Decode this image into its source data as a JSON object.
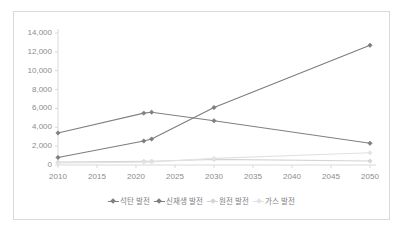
{
  "chart_data": {
    "type": "line",
    "title": "",
    "xlabel": "",
    "ylabel": "",
    "x": [
      2010,
      2021,
      2022,
      2030,
      2050
    ],
    "xlim": [
      2010,
      2050
    ],
    "ylim": [
      0,
      14000
    ],
    "ytick_step": 2000,
    "xtick_step": 5,
    "grid": false,
    "legend_position": "bottom",
    "xticks": [
      "2010",
      "2015",
      "2020",
      "2025",
      "2030",
      "2035",
      "2040",
      "2045",
      "2050"
    ],
    "yticks": [
      "0",
      "2,000",
      "4,000",
      "6,000",
      "8,000",
      "10,000",
      "12,000",
      "14,000"
    ],
    "series": [
      {
        "name": "석탄 발전",
        "color": "#808080",
        "values": [
          3400,
          5500,
          5600,
          4700,
          2300
        ]
      },
      {
        "name": "신재생 발전",
        "color": "#7d7d7d",
        "values": [
          800,
          2550,
          2750,
          6100,
          12700
        ]
      },
      {
        "name": "원전 발전",
        "color": "#d4d4d4",
        "values": [
          300,
          380,
          400,
          600,
          420
        ]
      },
      {
        "name": "가스 발전",
        "color": "#e2e2e2",
        "values": [
          220,
          300,
          320,
          700,
          1300
        ]
      }
    ]
  },
  "axis": {
    "y_labels": [
      "14,000",
      "12,000",
      "10,000",
      "8,000",
      "6,000",
      "4,000",
      "2,000",
      "0"
    ],
    "x_labels": [
      "2010",
      "2015",
      "2020",
      "2025",
      "2030",
      "2035",
      "2040",
      "2045",
      "2050"
    ]
  },
  "legend": {
    "items": [
      {
        "label": "석탄 발전",
        "color": "#808080"
      },
      {
        "label": "신재생 발전",
        "color": "#7d7d7d"
      },
      {
        "label": "원전 발전",
        "color": "#d4d4d4"
      },
      {
        "label": "가스 발전",
        "color": "#e2e2e2"
      }
    ]
  },
  "colors": {
    "frame_border": "#d9d9d9",
    "axis_line": "#d9d9d9",
    "tick_text": "#8c8c8c",
    "background": "#ffffff"
  }
}
